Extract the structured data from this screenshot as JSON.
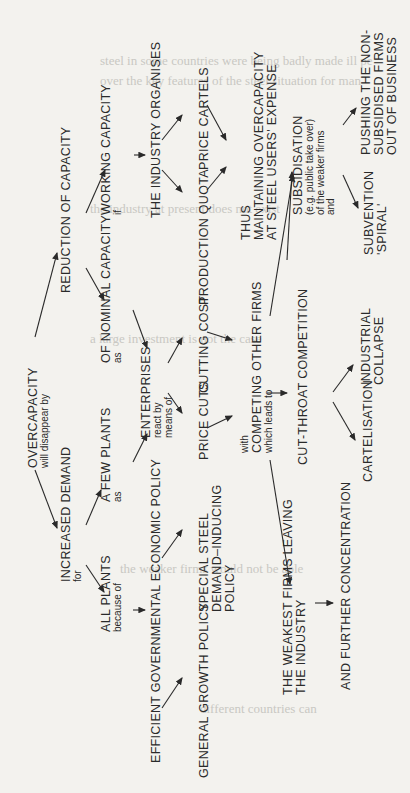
{
  "diagram": {
    "orientation": "rotated-90-ccw",
    "nodes": {
      "overcapacity": {
        "main": "OVERCAPACITY",
        "sub": "will disappear by"
      },
      "increased_demand": {
        "main": "INCREASED DEMAND",
        "sub": "for"
      },
      "reduction": {
        "main": "REDUCTION OF CAPACITY"
      },
      "all_plants": {
        "main": "ALL PLANTS",
        "sub": "because of"
      },
      "few_plants": {
        "main": "A FEW PLANTS",
        "sub": "as"
      },
      "working_capacity": {
        "main": "WORKING CAPACITY",
        "sub": "if"
      },
      "nominal_capacity": {
        "main": "OF NOMINAL CAPACITY",
        "sub": "as"
      },
      "efficient_policy": {
        "main": "EFFICIENT GOVERNMENTAL ECONOMIC POLICY"
      },
      "general_growth": {
        "main": "GENERAL GROWTH POLICY"
      },
      "special_steel": {
        "lines": [
          "SPECIAL STEEL",
          "DEMAND–INDUCING",
          "POLICY"
        ]
      },
      "enterprises": {
        "main": "ENTERPRISES",
        "sub1": "react by",
        "sub2": "means of"
      },
      "industry_organises": {
        "main": "THE INDUSTRY ORGANISES"
      },
      "price_cuts": {
        "main": "PRICE CUTS"
      },
      "cutting_cost": {
        "main": "CUTTING COST"
      },
      "production_quota": {
        "main": "PRODUCTION QUOTA"
      },
      "price_cartels": {
        "main": "PRICE CARTELS"
      },
      "competing": {
        "pre": "with",
        "main": "COMPETING OTHER FIRMS",
        "sub": "which leads to"
      },
      "thus_maintaining": {
        "lines": [
          "THUS",
          "MAINTAINING OVERCAPACITY",
          "AT STEEL USERS' EXPENSE"
        ]
      },
      "weakest_firms": {
        "lines": [
          "THE WEAKEST FIRMS LEAVING",
          "THE INDUSTRY"
        ]
      },
      "cut_throat": {
        "main": "CUT-THROAT COMPETITION"
      },
      "further_concentration": {
        "main": "AND FURTHER CONCENTRATION"
      },
      "cartelisation": {
        "main": "CARTELISATION"
      },
      "industrial_collapse": {
        "lines": [
          "INDUSTRIAL",
          "COLLAPSE"
        ]
      },
      "subsidisation": {
        "main": "SUBSIDISATION",
        "subs": [
          "(e.g. public take over)",
          "of the weaker firms",
          "and"
        ]
      },
      "subvention": {
        "lines": [
          "SUBVENTION",
          "'SPIRAL'"
        ]
      },
      "pushing": {
        "lines": [
          "PUSHING THE NON-",
          "SUBSIDISED FIRMS",
          "OUT OF BUSINESS"
        ]
      }
    },
    "colors": {
      "paper": "#f3f2ee",
      "ink": "#2a2a2a",
      "bleed_through": "#c9c8c3"
    }
  }
}
